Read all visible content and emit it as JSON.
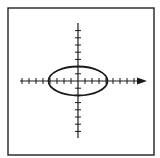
{
  "figure": {
    "frame": {
      "x": 8,
      "y": 8,
      "width": 146,
      "height": 147,
      "stroke": "#222222",
      "stroke_width": 1.4
    },
    "colors": {
      "background": "#ffffff",
      "ink": "#1a1a1a"
    },
    "origin": {
      "x": 78,
      "y": 81
    },
    "x_axis": {
      "x_start": 20,
      "x_end": 147,
      "y": 81,
      "arrow": "right",
      "tick_spacing": 7,
      "tick_half_length": 3,
      "ticks_left": 8,
      "ticks_right": 9
    },
    "y_axis": {
      "x": 78,
      "y_start": 23,
      "y_end": 138,
      "arrow": "none",
      "tick_spacing": 7.2,
      "tick_half_length": 3,
      "ticks_up": 7,
      "ticks_down": 7
    },
    "ellipse": {
      "cx": 78,
      "cy": 81,
      "rx": 29.5,
      "ry": 14.5,
      "stroke_width": 1.8
    }
  }
}
